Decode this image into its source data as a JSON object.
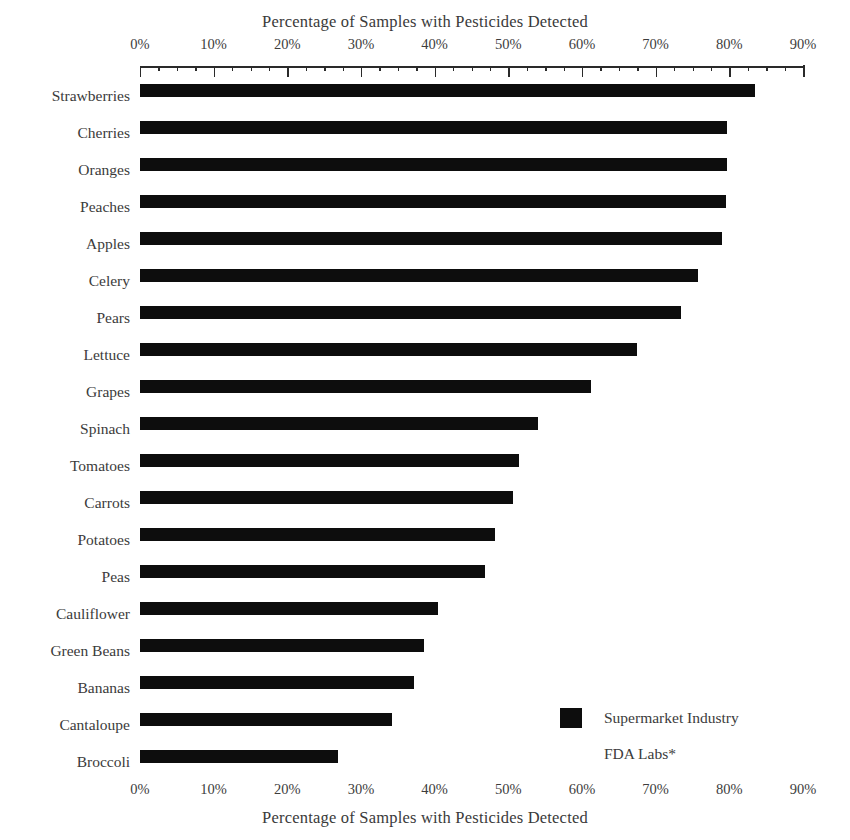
{
  "chart_data": {
    "type": "bar",
    "orientation": "horizontal",
    "title": "",
    "top_axis_title": "Percentage of Samples with Pesticides Detected",
    "bottom_axis_title": "Percentage of Samples with Pesticides Detected",
    "xlabel": "Percentage of Samples with Pesticides Detected",
    "ylabel": "",
    "xlim": [
      0,
      90
    ],
    "xticks": [
      0,
      10,
      20,
      30,
      40,
      50,
      60,
      70,
      80,
      90
    ],
    "xticklabels": [
      "0%",
      "10%",
      "20%",
      "30%",
      "40%",
      "50%",
      "60%",
      "70%",
      "80%",
      "90%"
    ],
    "minor_tick_interval": 2.5,
    "grid": false,
    "legend_position": "bottom-right",
    "categories": [
      "Strawberries",
      "Cherries",
      "Oranges",
      "Peaches",
      "Apples",
      "Celery",
      "Pears",
      "Lettuce",
      "Grapes",
      "Spinach",
      "Tomatoes",
      "Carrots",
      "Potatoes",
      "Peas",
      "Cauliflower",
      "Green Beans",
      "Bananas",
      "Cantaloupe",
      "Broccoli"
    ],
    "series": [
      {
        "name": "Supermarket Industry",
        "color": "#0d0d0d",
        "values": [
          83.5,
          79.7,
          79.7,
          79.6,
          79.0,
          75.7,
          73.5,
          67.4,
          61.2,
          54.0,
          51.5,
          50.6,
          48.2,
          46.8,
          40.4,
          38.6,
          37.2,
          34.2,
          26.9
        ]
      },
      {
        "name": "FDA Labs*",
        "color": "#ffffff",
        "values": [
          0,
          0,
          0,
          0,
          0,
          0,
          0,
          0,
          0,
          0,
          0,
          0,
          0,
          0,
          0,
          0,
          0,
          0,
          0
        ]
      }
    ]
  },
  "legend": {
    "items": [
      {
        "label": "Supermarket Industry",
        "swatch": "dark"
      },
      {
        "label": "FDA Labs*",
        "swatch": "light"
      }
    ]
  }
}
